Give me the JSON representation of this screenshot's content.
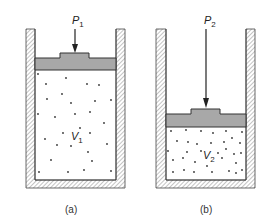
{
  "figure": {
    "panels": [
      {
        "id": "a",
        "caption": "(a)",
        "pressure_label": "P",
        "pressure_sub": "1",
        "volume_label": "V",
        "volume_sub": "1"
      },
      {
        "id": "b",
        "caption": "(b)",
        "pressure_label": "P",
        "pressure_sub": "2",
        "volume_label": "V",
        "volume_sub": "2"
      }
    ],
    "colors": {
      "piston": "#a8a8a8",
      "wall_hatch": "#777777",
      "outline": "#333333",
      "particles": "#333333"
    }
  }
}
